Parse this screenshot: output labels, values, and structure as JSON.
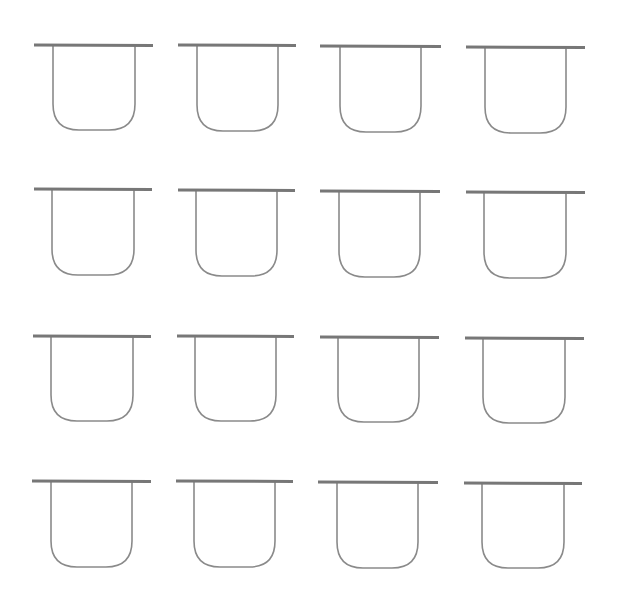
{
  "diagram": {
    "layout": {
      "rows": 4,
      "cols": 4
    },
    "stroke_color": "#8a8a8a",
    "bar_color": "#777777",
    "shapes": [
      {
        "bar": [
          34,
          45,
          153
        ],
        "u": [
          53,
          135,
          130
        ]
      },
      {
        "bar": [
          178,
          45,
          296
        ],
        "u": [
          197,
          278,
          131
        ]
      },
      {
        "bar": [
          320,
          46,
          441
        ],
        "u": [
          340,
          421,
          132
        ]
      },
      {
        "bar": [
          466,
          47,
          585
        ],
        "u": [
          485,
          566,
          133
        ]
      },
      {
        "bar": [
          34,
          189,
          152
        ],
        "u": [
          52,
          134,
          275
        ]
      },
      {
        "bar": [
          178,
          190,
          295
        ],
        "u": [
          196,
          277,
          276
        ]
      },
      {
        "bar": [
          320,
          191,
          440
        ],
        "u": [
          339,
          420,
          277
        ]
      },
      {
        "bar": [
          466,
          192,
          585
        ],
        "u": [
          484,
          566,
          278
        ]
      },
      {
        "bar": [
          33,
          336,
          151
        ],
        "u": [
          51,
          133,
          421
        ]
      },
      {
        "bar": [
          177,
          336,
          294
        ],
        "u": [
          195,
          276,
          421
        ]
      },
      {
        "bar": [
          320,
          337,
          439
        ],
        "u": [
          338,
          419,
          422
        ]
      },
      {
        "bar": [
          465,
          338,
          584
        ],
        "u": [
          483,
          565,
          423
        ]
      },
      {
        "bar": [
          32,
          481,
          151
        ],
        "u": [
          51,
          132,
          567
        ]
      },
      {
        "bar": [
          176,
          481,
          293
        ],
        "u": [
          194,
          275,
          567
        ]
      },
      {
        "bar": [
          318,
          482,
          438
        ],
        "u": [
          337,
          418,
          568
        ]
      },
      {
        "bar": [
          464,
          483,
          582
        ],
        "u": [
          482,
          564,
          568
        ]
      }
    ]
  }
}
